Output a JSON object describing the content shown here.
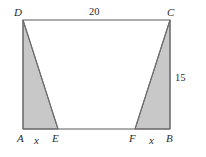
{
  "figure": {
    "shape": "rectangle",
    "vertices": {
      "A": "A",
      "B": "B",
      "C": "C",
      "D": "D",
      "E": "E",
      "F": "F"
    },
    "measures": {
      "top_side": "20",
      "right_side": "15",
      "left_segment": "x",
      "right_segment": "x"
    },
    "colors": {
      "shading": "#c8c8c8",
      "stroke": "#555555",
      "background": "#ffffff",
      "label": "#2b2b2b"
    }
  },
  "geometry": {
    "rect": {
      "x": 23,
      "y": 20,
      "width": 147,
      "height": 109
    },
    "points": {
      "A": {
        "x": 23,
        "y": 129
      },
      "B": {
        "x": 170,
        "y": 129
      },
      "C": {
        "x": 170,
        "y": 20
      },
      "D": {
        "x": 23,
        "y": 20
      },
      "E": {
        "x": 58,
        "y": 129
      },
      "F": {
        "x": 135,
        "y": 129
      }
    },
    "shaded_triangles": [
      {
        "name": "triangle-ADE",
        "points": "23,20 23,129 58,129"
      },
      {
        "name": "triangle-BCF",
        "points": "170,20 170,129 135,129"
      }
    ]
  }
}
